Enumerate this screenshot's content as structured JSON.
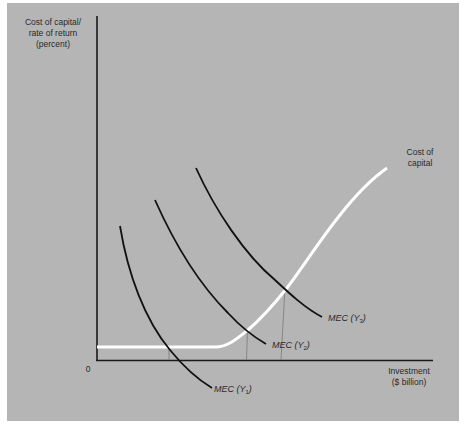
{
  "diagram": {
    "y_axis_label": [
      "Cost of capital/",
      "rate of return",
      "(percent)"
    ],
    "x_axis_label": [
      "Investment",
      "($ billion)"
    ],
    "origin_label": "0",
    "cost_of_capital_label": [
      "Cost of",
      "capital"
    ],
    "curves": [
      {
        "id": "mec-y1",
        "label_prefix": "MEC (Y",
        "subscript": "1",
        "label_suffix": ")"
      },
      {
        "id": "mec-y2",
        "label_prefix": "MEC (Y",
        "subscript": "2",
        "label_suffix": ")"
      },
      {
        "id": "mec-y3",
        "label_prefix": "MEC (Y",
        "subscript": "3",
        "label_suffix": ")"
      }
    ],
    "colors": {
      "background": "#b5b5b5",
      "mec_curve": "#111111",
      "cost_of_capital_curve": "#ffffff",
      "axis": "#1a1a1a",
      "drop_line": "#7a7a7a"
    }
  }
}
